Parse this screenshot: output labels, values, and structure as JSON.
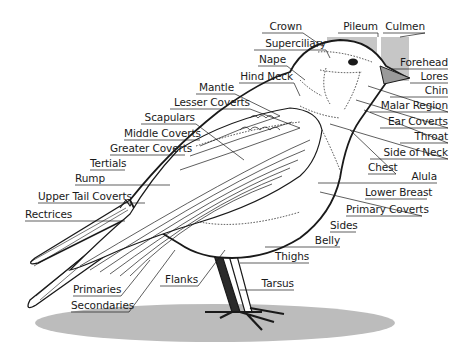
{
  "diagram": {
    "colors": {
      "ink": "#1a1a1a",
      "shadow": "#b9b9b9",
      "head_box": "#c4c4c4",
      "background": "#ffffff"
    },
    "labels": [
      {
        "id": "crown",
        "text": "Crown",
        "x": 262,
        "y": 20,
        "w": 40,
        "align": "right"
      },
      {
        "id": "superciliary",
        "text": "Superciliary",
        "x": 254,
        "y": 37,
        "w": 72,
        "align": "right"
      },
      {
        "id": "nape",
        "text": "Nape",
        "x": 258,
        "y": 53,
        "w": 28,
        "align": "right"
      },
      {
        "id": "hind-neck",
        "text": "Hind Neck",
        "x": 239,
        "y": 70,
        "w": 54,
        "align": "right"
      },
      {
        "id": "mantle",
        "text": "Mantle",
        "x": 196,
        "y": 81,
        "w": 38,
        "align": "right"
      },
      {
        "id": "lesser-coverts",
        "text": "Lesser Coverts",
        "x": 170,
        "y": 96,
        "w": 80,
        "align": "right"
      },
      {
        "id": "scapulars",
        "text": "Scapulars",
        "x": 141,
        "y": 111,
        "w": 54,
        "align": "right"
      },
      {
        "id": "middle-coverts",
        "text": "Middle Coverts",
        "x": 124,
        "y": 127,
        "w": 76,
        "align": "right"
      },
      {
        "id": "greater-coverts",
        "text": "Greater Coverts",
        "x": 110,
        "y": 142,
        "w": 74,
        "align": "right"
      },
      {
        "id": "tertials",
        "text": "Tertials",
        "x": 90,
        "y": 157,
        "w": 34,
        "align": "right"
      },
      {
        "id": "rump",
        "text": "Rump",
        "x": 75,
        "y": 172,
        "w": 30,
        "align": "right"
      },
      {
        "id": "upper-tail-coverts",
        "text": "Upper Tail Coverts",
        "x": 38,
        "y": 190,
        "w": 90,
        "align": "right"
      },
      {
        "id": "rectrices",
        "text": "Rectrices",
        "x": 25,
        "y": 208,
        "w": 45,
        "align": "right"
      },
      {
        "id": "pileum",
        "text": "Pileum",
        "x": 338,
        "y": 20,
        "w": 40,
        "align": "right"
      },
      {
        "id": "culmen",
        "text": "Culmen",
        "x": 383,
        "y": 20,
        "w": 42,
        "align": "right"
      },
      {
        "id": "forehead",
        "text": "Forehead",
        "x": 392,
        "y": 56,
        "w": 56,
        "align": "right"
      },
      {
        "id": "lores",
        "text": "Lores",
        "x": 410,
        "y": 70,
        "w": 38,
        "align": "right"
      },
      {
        "id": "chin",
        "text": "Chin",
        "x": 415,
        "y": 84,
        "w": 33,
        "align": "right"
      },
      {
        "id": "malar-region",
        "text": "Malar Region",
        "x": 370,
        "y": 99,
        "w": 78,
        "align": "right"
      },
      {
        "id": "ear-coverts",
        "text": "Ear Coverts",
        "x": 380,
        "y": 115,
        "w": 68,
        "align": "right"
      },
      {
        "id": "throat",
        "text": "Throat",
        "x": 400,
        "y": 130,
        "w": 48,
        "align": "right"
      },
      {
        "id": "side-of-neck",
        "text": "Side of Neck",
        "x": 370,
        "y": 146,
        "w": 78,
        "align": "right"
      },
      {
        "id": "chest",
        "text": "Chest",
        "x": 368,
        "y": 161,
        "w": 28,
        "align": "right"
      },
      {
        "id": "alula",
        "text": "Alula",
        "x": 405,
        "y": 170,
        "w": 32,
        "align": "right"
      },
      {
        "id": "lower-breast",
        "text": "Lower Breast",
        "x": 365,
        "y": 186,
        "w": 62,
        "align": "right"
      },
      {
        "id": "primary-coverts",
        "text": "Primary Coverts",
        "x": 346,
        "y": 203,
        "w": 76,
        "align": "right"
      },
      {
        "id": "sides",
        "text": "Sides",
        "x": 330,
        "y": 219,
        "w": 26,
        "align": "right"
      },
      {
        "id": "belly",
        "text": "Belly",
        "x": 310,
        "y": 234,
        "w": 30,
        "align": "right"
      },
      {
        "id": "thighs",
        "text": "Thighs",
        "x": 275,
        "y": 250,
        "w": 34,
        "align": "right"
      },
      {
        "id": "tarsus",
        "text": "Tarsus",
        "x": 258,
        "y": 277,
        "w": 36,
        "align": "right"
      },
      {
        "id": "flanks",
        "text": "Flanks",
        "x": 160,
        "y": 273,
        "w": 38,
        "align": "right"
      },
      {
        "id": "primaries",
        "text": "Primaries",
        "x": 73,
        "y": 283,
        "w": 48,
        "align": "right"
      },
      {
        "id": "secondaries",
        "text": "Secondaries",
        "x": 71,
        "y": 299,
        "w": 58,
        "align": "right"
      }
    ]
  }
}
